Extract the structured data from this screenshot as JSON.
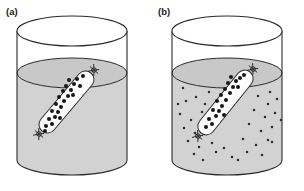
{
  "figure": {
    "caption_panels": [
      {
        "id": "a",
        "label": "(a)",
        "label_x": 6,
        "label_y": 15
      },
      {
        "id": "b",
        "label": "(b)",
        "label_x": 158,
        "label_y": 15
      }
    ],
    "colors": {
      "background": "#ffffff",
      "liquid_fill": "#d2d2d2",
      "liquid_surface": "#c8c8c8",
      "beaker_outline": "#2b2b2b",
      "bag_fill": "#fdfdfd",
      "bag_outline": "#2b2b2b",
      "solute_dot": "#171717",
      "small_dot": "#2e2e2e",
      "label_text": "#1a1a1a"
    },
    "panels": [
      {
        "id": "a",
        "name": "dialysis-bag-before-diffusion",
        "beaker": {
          "center_x": 72,
          "top_rim_y": 31,
          "bottom_y": 160,
          "radius_x": 55,
          "radius_y": 15,
          "liquid_surface_y": 73
        },
        "bag": {
          "x1": 42,
          "y1": 131,
          "x2": 91,
          "y2": 73,
          "half_width": 8.5,
          "knots": [
            {
              "x": 39,
              "y": 134
            },
            {
              "x": 94,
              "y": 70
            }
          ],
          "solutes": [
            [
              46,
              126
            ],
            [
              52,
              124
            ],
            [
              49,
              119
            ],
            [
              55,
              117
            ],
            [
              58,
              112
            ],
            [
              52,
              111
            ],
            [
              61,
              107
            ],
            [
              56,
              104
            ],
            [
              64,
              101
            ],
            [
              59,
              97
            ],
            [
              68,
              96
            ],
            [
              63,
              91
            ],
            [
              71,
              90
            ],
            [
              66,
              86
            ],
            [
              74,
              84
            ],
            [
              69,
              80
            ],
            [
              77,
              79
            ],
            [
              83,
              76
            ],
            [
              80,
              86
            ],
            [
              45,
              131
            ],
            [
              60,
              118
            ],
            [
              73,
              95
            ]
          ]
        },
        "external_solutes": []
      },
      {
        "id": "b",
        "name": "dialysis-bag-after-diffusion",
        "beaker": {
          "center_x": 227,
          "top_rim_y": 31,
          "bottom_y": 160,
          "radius_x": 55,
          "radius_y": 15,
          "liquid_surface_y": 73
        },
        "bag": {
          "x1": 201,
          "y1": 133,
          "x2": 250,
          "y2": 72,
          "half_width": 8.5,
          "knots": [
            {
              "x": 198,
              "y": 136
            },
            {
              "x": 253,
              "y": 69
            }
          ],
          "solutes": [
            [
              206,
              127
            ],
            [
              212,
              124
            ],
            [
              209,
              119
            ],
            [
              216,
              116
            ],
            [
              219,
              111
            ],
            [
              213,
              110
            ],
            [
              222,
              106
            ],
            [
              217,
              101
            ],
            [
              226,
              100
            ],
            [
              221,
              95
            ],
            [
              230,
              93
            ],
            [
              225,
              89
            ],
            [
              233,
              87
            ],
            [
              228,
              83
            ],
            [
              236,
              81
            ],
            [
              231,
              77
            ],
            [
              240,
              78
            ],
            [
              244,
              75
            ],
            [
              238,
              87
            ],
            [
              224,
              115
            ]
          ]
        },
        "external_solutes": [
          [
            183,
            88
          ],
          [
            199,
            83
          ],
          [
            211,
            79
          ],
          [
            247,
            84
          ],
          [
            263,
            81
          ],
          [
            270,
            92
          ],
          [
            186,
            101
          ],
          [
            196,
            97
          ],
          [
            205,
            104
          ],
          [
            258,
            96
          ],
          [
            268,
            104
          ],
          [
            277,
            99
          ],
          [
            180,
            114
          ],
          [
            191,
            120
          ],
          [
            202,
            112
          ],
          [
            254,
            110
          ],
          [
            265,
            117
          ],
          [
            275,
            113
          ],
          [
            184,
            128
          ],
          [
            195,
            133
          ],
          [
            207,
            126
          ],
          [
            249,
            124
          ],
          [
            261,
            131
          ],
          [
            272,
            127
          ],
          [
            188,
            141
          ],
          [
            199,
            147
          ],
          [
            212,
            143
          ],
          [
            243,
            139
          ],
          [
            256,
            145
          ],
          [
            268,
            140
          ],
          [
            194,
            154
          ],
          [
            216,
            152
          ],
          [
            232,
            157
          ],
          [
            247,
            152
          ],
          [
            262,
            155
          ],
          [
            224,
            148
          ],
          [
            178,
            104
          ],
          [
            281,
            120
          ],
          [
            203,
            160
          ],
          [
            238,
            160
          ],
          [
            209,
            92
          ],
          [
            272,
            142
          ]
        ]
      }
    ]
  }
}
